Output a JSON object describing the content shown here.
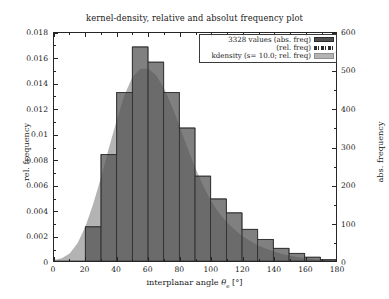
{
  "chart_data": {
    "type": "bar",
    "title": "kernel-density, relative and absolut frequency plot",
    "xlabel_parts": {
      "pre": "interplanar angle ",
      "symbol": "θ",
      "subscript": "e",
      "post": " [°]"
    },
    "xlabel": "interplanar angle θe [°]",
    "ylabel_left": "rel. frequency",
    "ylabel_right": "abs. frequency",
    "xlim": [
      0,
      180
    ],
    "ylim_left": [
      0,
      0.018
    ],
    "ylim_right": [
      0,
      600
    ],
    "xticks": [
      0,
      20,
      40,
      60,
      80,
      100,
      120,
      140,
      160,
      180
    ],
    "xtick_labels": [
      "0",
      "20",
      "40",
      "60",
      "80",
      "100",
      "120",
      "140",
      "160",
      "180"
    ],
    "yticks_left": [
      0,
      0.002,
      0.004,
      0.006,
      0.008,
      0.01,
      0.012,
      0.014,
      0.016,
      0.018
    ],
    "ytick_labels_left": [
      "0",
      "0.002",
      "0.004",
      "0.006",
      "0.008",
      "0.01",
      "0.012",
      "0.014",
      "0.016",
      "0.018"
    ],
    "yticks_right": [
      0,
      100,
      200,
      300,
      400,
      500,
      600
    ],
    "ytick_labels_right": [
      "0",
      "100",
      "200",
      "300",
      "400",
      "500",
      "600"
    ],
    "grid": false,
    "n_values": 3328,
    "bin_width": 10,
    "bin_edges": [
      0,
      10,
      20,
      30,
      40,
      50,
      60,
      70,
      80,
      90,
      100,
      110,
      120,
      130,
      140,
      150,
      160,
      170,
      180
    ],
    "series": [
      {
        "name": "3328 values (abs. freq)",
        "kind": "bar",
        "color": "#4f4f4f",
        "bin_centers": [
          5,
          15,
          25,
          35,
          45,
          55,
          65,
          75,
          85,
          95,
          105,
          115,
          125,
          135,
          145,
          155,
          165,
          175
        ],
        "values_rel": [
          0.0,
          0.0,
          0.0027,
          0.0084,
          0.0133,
          0.0169,
          0.0157,
          0.0133,
          0.0105,
          0.0067,
          0.0049,
          0.0038,
          0.0025,
          0.0017,
          0.001,
          0.0006,
          0.0003,
          0.0001
        ],
        "values_abs": [
          0,
          0,
          90,
          280,
          443,
          563,
          523,
          443,
          350,
          223,
          163,
          127,
          83,
          57,
          33,
          20,
          10,
          3
        ]
      },
      {
        "name": "(rel. freq)",
        "kind": "dashed-outline",
        "color": "#2b2b2b"
      },
      {
        "name": "kdensity (s= 10.0; rel. freq)",
        "kind": "area",
        "color": "#b3b3b3",
        "bandwidth": 10.0,
        "x": [
          0,
          5,
          10,
          15,
          20,
          25,
          30,
          35,
          40,
          45,
          50,
          55,
          60,
          65,
          70,
          75,
          80,
          85,
          90,
          95,
          100,
          105,
          110,
          115,
          120,
          125,
          130,
          135,
          140,
          145,
          150,
          155,
          160,
          165,
          170,
          175,
          180
        ],
        "y": [
          8e-05,
          0.00022,
          0.0006,
          0.0014,
          0.0027,
          0.0045,
          0.0066,
          0.0089,
          0.0111,
          0.0131,
          0.0145,
          0.01515,
          0.0152,
          0.0147,
          0.0137,
          0.0123,
          0.0107,
          0.009,
          0.0074,
          0.006,
          0.0048,
          0.00385,
          0.0031,
          0.0025,
          0.002,
          0.0016,
          0.00125,
          0.00098,
          0.00076,
          0.00058,
          0.00044,
          0.00032,
          0.00023,
          0.00016,
          0.0001,
          5e-05,
          2e-05
        ]
      }
    ],
    "legend": {
      "position": "upper-right",
      "entries": [
        {
          "label": "3328 values (abs. freq)",
          "swatch": "solid-dark"
        },
        {
          "label": "(rel. freq)",
          "swatch": "dash-dot-line"
        },
        {
          "label": "kdensity (s= 10.0; rel. freq)",
          "swatch": "solid-light"
        }
      ]
    }
  },
  "colors": {
    "bar_fill": "#4f4f4f",
    "bar_edge": "#2b2b2b",
    "kde_fill": "#b3b3b3",
    "axis": "#262626",
    "background": "#ffffff",
    "text": "#1a1a1a"
  }
}
